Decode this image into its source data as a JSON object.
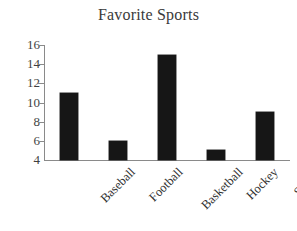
{
  "chart_data": {
    "type": "bar",
    "title": "Favorite Sports",
    "xlabel": "",
    "ylabel": "",
    "categories": [
      "Baseball",
      "Football",
      "Basketball",
      "Hockey",
      "Soccer"
    ],
    "values": [
      11,
      6,
      15,
      5,
      9
    ],
    "ylim": [
      4,
      16
    ],
    "ytick_values": [
      16,
      14,
      12,
      10,
      8,
      6,
      4
    ],
    "ytick_labels": [
      "16",
      "14",
      "12",
      "10",
      "8",
      "6",
      "4"
    ],
    "grid": false,
    "legend": null,
    "legend_position": "none",
    "bar_color": "#161616",
    "axis_color": "#8a8a8a",
    "title_color": "#3a3a3a",
    "tick_label_color": "#3f3f3f",
    "category_label_color": "#2e2e2e",
    "background_color": "#ffffff",
    "x_label_rotation_deg": -45
  }
}
